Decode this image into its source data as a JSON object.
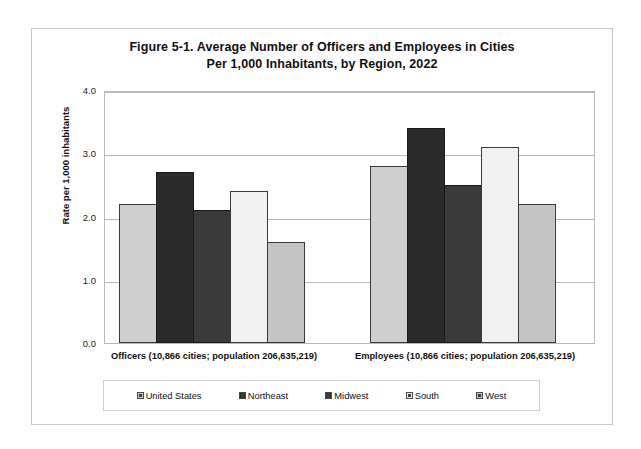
{
  "figure": {
    "title_line1": "Figure 5-1. Average Number of Officers and Employees in Cities",
    "title_line2": "Per 1,000 Inhabitants, by Region, 2022"
  },
  "chart_data": {
    "type": "bar",
    "title": "Figure 5-1. Average Number of Officers and Employees in Cities Per 1,000 Inhabitants, by Region, 2022",
    "xlabel": "",
    "ylabel": "Rate per 1,000 inhabitants",
    "ylim": [
      0.0,
      4.0
    ],
    "ytick_labels": [
      "0.0",
      "1.0",
      "2.0",
      "3.0",
      "4.0"
    ],
    "ytick_values": [
      0.0,
      1.0,
      2.0,
      3.0,
      4.0
    ],
    "grid": true,
    "legend_position": "bottom",
    "categories": [
      "Officers (10,866 cities; population 206,635,219)",
      "Employees (10,866 cities; population 206,635,219)"
    ],
    "series": [
      {
        "name": "United States",
        "values": [
          2.2,
          2.8
        ],
        "color": "#cfcfcf"
      },
      {
        "name": "Northeast",
        "values": [
          2.7,
          3.4
        ],
        "color": "#2b2b2b"
      },
      {
        "name": "Midwest",
        "values": [
          2.1,
          2.5
        ],
        "color": "#3a3a3a"
      },
      {
        "name": "South",
        "values": [
          2.4,
          3.1
        ],
        "color": "#f1f1f1"
      },
      {
        "name": "West",
        "values": [
          1.6,
          2.2
        ],
        "color": "#c4c4c4"
      }
    ]
  }
}
